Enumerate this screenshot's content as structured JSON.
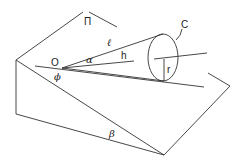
{
  "diagram": {
    "labels": {
      "plane": "Π",
      "origin": "O",
      "slant": "ℓ",
      "half_angle": "α",
      "height": "h",
      "cone_base": "C",
      "radius": "r",
      "phi": "ϕ",
      "beta": "β"
    }
  }
}
